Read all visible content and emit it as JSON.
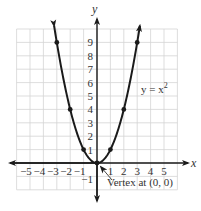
{
  "chart_data": {
    "type": "line",
    "title": "",
    "function_label": "y = x²",
    "function_label_base": "y = x",
    "function_label_exp": "2",
    "xlabel": "x",
    "ylabel": "y",
    "xlim": [
      -6,
      6
    ],
    "ylim": [
      -2,
      10
    ],
    "grid": true,
    "x_ticks": [
      "-5",
      "-4",
      "-3",
      "-2",
      "-1",
      "1",
      "2",
      "3",
      "4",
      "5"
    ],
    "y_ticks": [
      "-1",
      "1",
      "2",
      "3",
      "4",
      "5",
      "6",
      "7",
      "8",
      "9"
    ],
    "series": [
      {
        "name": "y = x^2",
        "x": [
          -3,
          -2,
          -1,
          0,
          1,
          2,
          3
        ],
        "y": [
          9,
          4,
          1,
          0,
          1,
          4,
          9
        ]
      }
    ],
    "annotations": [
      {
        "text": "Vertex at (0, 0)",
        "x": 0,
        "y": 0
      }
    ]
  },
  "labels": {
    "x_axis": "x",
    "y_axis": "y",
    "vertex": "Vertex at (0, 0)",
    "fn_base": "y = x",
    "fn_exp": "2"
  },
  "ticks": {
    "x_neg": [
      "-5",
      "-4",
      "-3",
      "-2",
      "-1"
    ],
    "x_pos": [
      "1",
      "2",
      "3",
      "4",
      "5"
    ],
    "y_pos": [
      "1",
      "2",
      "3",
      "4",
      "5",
      "6",
      "7",
      "8",
      "9"
    ],
    "y_neg": [
      "-1"
    ]
  }
}
